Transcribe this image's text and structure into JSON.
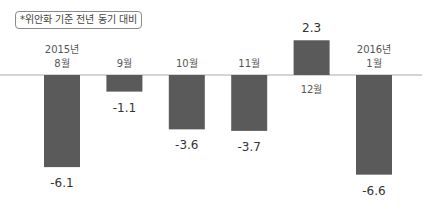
{
  "note": "*위안화 기준 전년 동기 대비",
  "chart_data": {
    "type": "bar",
    "title": "",
    "xlabel": "",
    "ylabel": "",
    "grid": false,
    "categories": [
      [
        "2015년",
        "8월"
      ],
      [
        "9월"
      ],
      [
        "10월"
      ],
      [
        "11월"
      ],
      [
        "12월"
      ],
      [
        "2016년",
        "1월"
      ]
    ],
    "values": [
      -6.1,
      -1.1,
      -3.6,
      -3.7,
      2.3,
      -6.6
    ],
    "value_labels": [
      "-6.1",
      "-1.1",
      "-3.6",
      "-3.7",
      "2.3",
      "-6.6"
    ],
    "ylim": [
      -7,
      2.5
    ],
    "bar_color": "#5a5a5a",
    "axis_color": "#aaaaaa"
  }
}
